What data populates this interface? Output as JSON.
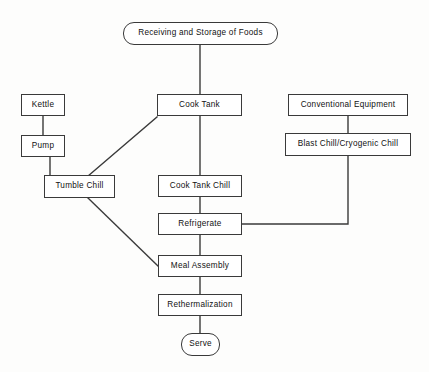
{
  "diagram": {
    "type": "flowchart",
    "background_color": "#fdfdfc",
    "line_color": "#3a3a3a",
    "text_color": "#111111",
    "nodes": [
      {
        "id": "receiving",
        "label": "Receiving and Storage of Foods",
        "shape": "rounded-rectangle",
        "x": 123,
        "y": 22,
        "w": 155,
        "h": 23
      },
      {
        "id": "kettle",
        "label": "Kettle",
        "shape": "rectangle",
        "x": 21,
        "y": 94,
        "w": 44,
        "h": 22
      },
      {
        "id": "cook_tank",
        "label": "Cook Tank",
        "shape": "rectangle",
        "x": 157,
        "y": 94,
        "w": 85,
        "h": 22
      },
      {
        "id": "conventional_equipment",
        "label": "Conventional Equipment",
        "shape": "rectangle",
        "x": 288,
        "y": 94,
        "w": 120,
        "h": 22
      },
      {
        "id": "pump",
        "label": "Pump",
        "shape": "rectangle",
        "x": 21,
        "y": 135,
        "w": 44,
        "h": 22
      },
      {
        "id": "blast_chill",
        "label": "Blast Chill/Cryogenic Chill",
        "shape": "rectangle",
        "x": 285,
        "y": 133,
        "w": 126,
        "h": 23
      },
      {
        "id": "tumble_chill",
        "label": "Tumble Chill",
        "shape": "rectangle",
        "x": 44,
        "y": 175,
        "w": 71,
        "h": 23
      },
      {
        "id": "cook_tank_chill",
        "label": "Cook Tank Chill",
        "shape": "rectangle",
        "x": 158,
        "y": 175,
        "w": 84,
        "h": 22
      },
      {
        "id": "refrigerate",
        "label": "Refrigerate",
        "shape": "rectangle",
        "x": 158,
        "y": 213,
        "w": 84,
        "h": 22
      },
      {
        "id": "meal_assembly",
        "label": "Meal Assembly",
        "shape": "rectangle",
        "x": 158,
        "y": 255,
        "w": 84,
        "h": 22
      },
      {
        "id": "rethermalization",
        "label": "Rethermalization",
        "shape": "rectangle",
        "x": 158,
        "y": 294,
        "w": 84,
        "h": 22
      },
      {
        "id": "serve",
        "label": "Serve",
        "shape": "rounded-rectangle",
        "x": 181,
        "y": 333,
        "w": 39,
        "h": 23
      }
    ],
    "edges": [
      {
        "from": "receiving",
        "to": "cook_tank",
        "kind": "vertical",
        "points": "200,45 200,94"
      },
      {
        "from": "kettle",
        "to": "pump",
        "kind": "vertical",
        "points": "43,116 43,135"
      },
      {
        "from": "pump",
        "to": "tumble_chill",
        "kind": "vertical",
        "points": "50,157 50,175"
      },
      {
        "from": "cook_tank",
        "to": "tumble_chill",
        "kind": "diagonal",
        "points": "157,117 88,176"
      },
      {
        "from": "cook_tank",
        "to": "cook_tank_chill",
        "kind": "vertical",
        "points": "200,116 200,175"
      },
      {
        "from": "conventional_equipment",
        "to": "blast_chill",
        "kind": "vertical",
        "points": "348,116 348,133"
      },
      {
        "from": "blast_chill",
        "to": "refrigerate",
        "kind": "elbow",
        "points": "348,156 348,224 242,224"
      },
      {
        "from": "cook_tank_chill",
        "to": "refrigerate",
        "kind": "vertical",
        "points": "200,197 200,213"
      },
      {
        "from": "tumble_chill",
        "to": "meal_assembly",
        "kind": "diagonal",
        "points": "88,198 158,266"
      },
      {
        "from": "refrigerate",
        "to": "meal_assembly",
        "kind": "vertical",
        "points": "200,235 200,255"
      },
      {
        "from": "meal_assembly",
        "to": "rethermalization",
        "kind": "vertical",
        "points": "200,277 200,294"
      },
      {
        "from": "rethermalization",
        "to": "serve",
        "kind": "vertical",
        "points": "200,316 200,333"
      }
    ]
  }
}
